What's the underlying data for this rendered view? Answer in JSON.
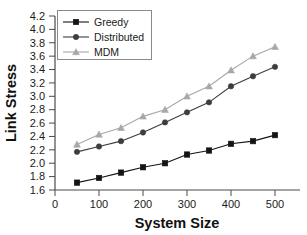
{
  "chart_data": {
    "type": "line",
    "title": "",
    "xlabel": "System Size",
    "ylabel": "Link Stress",
    "x": [
      50,
      100,
      150,
      200,
      250,
      300,
      350,
      400,
      450,
      500
    ],
    "xlim": [
      0,
      550
    ],
    "ylim": [
      1.6,
      4.2
    ],
    "xticks": [
      0,
      100,
      200,
      300,
      400,
      500
    ],
    "xtick_labels": [
      "0",
      "100",
      "200",
      "300",
      "400",
      "500"
    ],
    "yticks": [
      1.6,
      1.8,
      2.0,
      2.2,
      2.4,
      2.6,
      2.8,
      3.0,
      3.2,
      3.4,
      3.6,
      3.8,
      4.0,
      4.2
    ],
    "ytick_labels": [
      "1.6",
      "1.8",
      "2.0",
      "2.2",
      "2.4",
      "2.6",
      "2.8",
      "3.0",
      "3.2",
      "3.4",
      "3.6",
      "3.8",
      "4.0",
      "4.2"
    ],
    "grid": false,
    "legend_position": "upper-left-inside",
    "series": [
      {
        "name": "Greedy",
        "marker": "square",
        "color": "#141414",
        "values": [
          1.71,
          1.78,
          1.86,
          1.94,
          2.0,
          2.13,
          2.19,
          2.29,
          2.33,
          2.42
        ]
      },
      {
        "name": "Distributed",
        "marker": "circle",
        "color": "#3d3d3d",
        "values": [
          2.17,
          2.25,
          2.33,
          2.46,
          2.61,
          2.76,
          2.91,
          3.15,
          3.3,
          3.44
        ]
      },
      {
        "name": "MDM",
        "marker": "triangle",
        "color": "#a8a8a8",
        "values": [
          2.28,
          2.43,
          2.53,
          2.7,
          2.8,
          3.0,
          3.15,
          3.39,
          3.6,
          3.74
        ]
      }
    ]
  },
  "legend": {
    "items": [
      {
        "label": "Greedy"
      },
      {
        "label": "Distributed"
      },
      {
        "label": "MDM"
      }
    ]
  },
  "axes": {
    "x_title": "System Size",
    "y_title": "Link Stress"
  }
}
